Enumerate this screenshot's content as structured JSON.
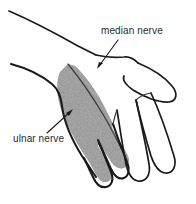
{
  "figure": {
    "background_color": "#ffffff",
    "ink_color": "#1a1a1a",
    "shade_color": "#8a8a8a",
    "labels": [
      {
        "id": "median-nerve",
        "text": "median nerve",
        "x": 101,
        "y": 34,
        "leader_from": [
          118,
          40
        ],
        "leader_to": [
          97,
          68
        ],
        "arrow_at": [
          97,
          68
        ]
      },
      {
        "id": "ulnar-nerve",
        "text": "ulnar nerve",
        "x": 13,
        "y": 142,
        "leader_from": [
          47,
          133
        ],
        "leader_to": [
          72,
          110
        ],
        "arrow_at": [
          72,
          110
        ]
      }
    ],
    "shaded_region_name": "ulnar-nerve-sensory-territory",
    "shaded_digits": [
      "little finger",
      "ring finger"
    ],
    "unshaded_digits": [
      "middle finger",
      "index finger",
      "thumb"
    ]
  }
}
